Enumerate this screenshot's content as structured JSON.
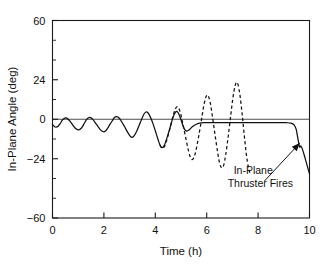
{
  "chart_data": {
    "type": "line",
    "title": "",
    "xlabel": "Time (h)",
    "ylabel": "In-Plane Angle (deg)",
    "xlim": [
      0,
      10
    ],
    "ylim": [
      -60,
      60
    ],
    "xticks": [
      0,
      2,
      4,
      6,
      8,
      10
    ],
    "xtick_labels": [
      "0",
      "2",
      "4",
      "6",
      "8",
      "10"
    ],
    "yticks": [
      -60,
      -24,
      0,
      24,
      60
    ],
    "ytick_labels": [
      "−60",
      "−24",
      "0",
      "24",
      "60"
    ],
    "y_minor_ticks": [
      -48,
      -36,
      -12,
      12,
      36,
      48
    ],
    "grid": false,
    "legend": false,
    "zero_reference_line": 0,
    "annotations": [
      {
        "name": "in-plane-thruster-fires",
        "lines": [
          "In-Plane",
          "Thruster Fires"
        ],
        "text_x": 7.05,
        "text_y": -33.0,
        "arrow_from_x": 8.25,
        "arrow_from_y": -37.5,
        "arrow_to_x": 9.62,
        "arrow_to_y": -14.5
      }
    ],
    "series": [
      {
        "name": "controlled-response",
        "style": "solid",
        "color": "#111111",
        "description": "Solid curve: growing libration oscillation that is damped out, settles near -2 deg, then sharp thruster-driven drop near t=9.6 h",
        "points": [
          [
            0.0,
            -3.2
          ],
          [
            0.07,
            -4.4
          ],
          [
            0.14,
            -4.8
          ],
          [
            0.22,
            -4.2
          ],
          [
            0.3,
            -2.6
          ],
          [
            0.38,
            -0.6
          ],
          [
            0.45,
            0.5
          ],
          [
            0.52,
            0.8
          ],
          [
            0.6,
            0.2
          ],
          [
            0.7,
            -1.6
          ],
          [
            0.8,
            -3.8
          ],
          [
            0.9,
            -5.6
          ],
          [
            1.0,
            -6.4
          ],
          [
            1.08,
            -6.0
          ],
          [
            1.16,
            -4.6
          ],
          [
            1.24,
            -2.4
          ],
          [
            1.32,
            -0.3
          ],
          [
            1.4,
            0.9
          ],
          [
            1.48,
            1.0
          ],
          [
            1.56,
            0.1
          ],
          [
            1.66,
            -2.0
          ],
          [
            1.78,
            -4.6
          ],
          [
            1.88,
            -6.6
          ],
          [
            1.98,
            -7.6
          ],
          [
            2.06,
            -7.2
          ],
          [
            2.14,
            -5.6
          ],
          [
            2.24,
            -3.0
          ],
          [
            2.34,
            -0.6
          ],
          [
            2.42,
            1.2
          ],
          [
            2.5,
            1.6
          ],
          [
            2.58,
            0.9
          ],
          [
            2.68,
            -1.2
          ],
          [
            2.8,
            -4.4
          ],
          [
            2.92,
            -7.8
          ],
          [
            3.02,
            -10.2
          ],
          [
            3.1,
            -11.0
          ],
          [
            3.18,
            -10.0
          ],
          [
            3.28,
            -7.2
          ],
          [
            3.38,
            -3.4
          ],
          [
            3.48,
            0.4
          ],
          [
            3.56,
            3.2
          ],
          [
            3.64,
            4.4
          ],
          [
            3.72,
            3.8
          ],
          [
            3.8,
            1.6
          ],
          [
            3.9,
            -2.2
          ],
          [
            4.0,
            -7.0
          ],
          [
            4.1,
            -12.0
          ],
          [
            4.18,
            -15.6
          ],
          [
            4.26,
            -17.2
          ],
          [
            4.34,
            -16.2
          ],
          [
            4.42,
            -13.0
          ],
          [
            4.52,
            -8.0
          ],
          [
            4.62,
            -2.6
          ],
          [
            4.7,
            1.6
          ],
          [
            4.78,
            4.2
          ],
          [
            4.84,
            4.8
          ],
          [
            4.9,
            3.6
          ],
          [
            4.98,
            0.6
          ],
          [
            5.06,
            -3.2
          ],
          [
            5.14,
            -6.2
          ],
          [
            5.22,
            -7.2
          ],
          [
            5.32,
            -6.4
          ],
          [
            5.44,
            -4.6
          ],
          [
            5.58,
            -3.2
          ],
          [
            5.72,
            -2.4
          ],
          [
            5.9,
            -2.1
          ],
          [
            6.2,
            -2.0
          ],
          [
            6.8,
            -2.0
          ],
          [
            7.5,
            -2.0
          ],
          [
            8.2,
            -2.0
          ],
          [
            8.8,
            -2.0
          ],
          [
            9.1,
            -2.1
          ],
          [
            9.28,
            -2.4
          ],
          [
            9.4,
            -3.4
          ],
          [
            9.48,
            -6.0
          ],
          [
            9.54,
            -11.0
          ],
          [
            9.58,
            -14.5
          ],
          [
            9.62,
            -17.0
          ],
          [
            9.66,
            -16.2
          ],
          [
            9.72,
            -18.0
          ],
          [
            9.8,
            -22.0
          ],
          [
            9.88,
            -26.5
          ],
          [
            9.95,
            -30.5
          ],
          [
            10.0,
            -33.0
          ]
        ]
      },
      {
        "name": "uncontrolled-response",
        "style": "dashed",
        "color": "#111111",
        "description": "Dashed curve: divergent libration that continues to grow in amplitude after t=4.2 h",
        "points": [
          [
            4.18,
            -15.6
          ],
          [
            4.26,
            -17.6
          ],
          [
            4.34,
            -17.0
          ],
          [
            4.42,
            -14.0
          ],
          [
            4.52,
            -8.6
          ],
          [
            4.62,
            -2.4
          ],
          [
            4.7,
            2.6
          ],
          [
            4.78,
            6.2
          ],
          [
            4.84,
            7.6
          ],
          [
            4.9,
            7.0
          ],
          [
            4.98,
            3.8
          ],
          [
            5.06,
            -2.0
          ],
          [
            5.16,
            -9.5
          ],
          [
            5.26,
            -17.0
          ],
          [
            5.34,
            -22.0
          ],
          [
            5.42,
            -24.4
          ],
          [
            5.5,
            -23.4
          ],
          [
            5.58,
            -19.0
          ],
          [
            5.68,
            -11.0
          ],
          [
            5.78,
            -2.0
          ],
          [
            5.86,
            6.0
          ],
          [
            5.94,
            12.0
          ],
          [
            6.0,
            14.5
          ],
          [
            6.06,
            14.2
          ],
          [
            6.14,
            10.0
          ],
          [
            6.22,
            2.0
          ],
          [
            6.32,
            -9.0
          ],
          [
            6.42,
            -19.5
          ],
          [
            6.5,
            -26.5
          ],
          [
            6.58,
            -29.5
          ],
          [
            6.66,
            -28.0
          ],
          [
            6.74,
            -21.5
          ],
          [
            6.84,
            -10.0
          ],
          [
            6.94,
            3.0
          ],
          [
            7.02,
            13.0
          ],
          [
            7.1,
            20.0
          ],
          [
            7.16,
            22.4
          ],
          [
            7.22,
            21.0
          ],
          [
            7.3,
            14.0
          ],
          [
            7.38,
            3.0
          ],
          [
            7.46,
            -9.5
          ],
          [
            7.54,
            -21.0
          ],
          [
            7.62,
            -29.0
          ],
          [
            7.68,
            -32.5
          ]
        ]
      }
    ]
  },
  "axes": {
    "ylabel": "In-Plane Angle (deg)",
    "xlabel": "Time (h)",
    "ytick_labels": [
      "60",
      "24",
      "0",
      "−24",
      "−60"
    ],
    "xtick_labels": [
      "0",
      "2",
      "4",
      "6",
      "8",
      "10"
    ]
  },
  "annotation_text": {
    "line1": "In-Plane",
    "line2": "Thruster Fires"
  }
}
